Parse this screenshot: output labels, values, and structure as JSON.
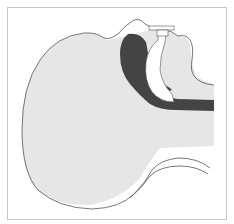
{
  "figure": {
    "colors": {
      "background": "#ffffff",
      "frame": "#c8c8c8",
      "tissue_fill": "#e6e6e6",
      "outline": "#555555",
      "airway_dark": "#444444",
      "device": "#ffffff"
    }
  }
}
